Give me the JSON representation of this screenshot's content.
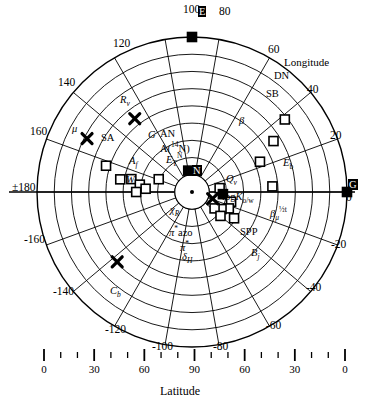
{
  "chart_data": {
    "type": "scatter",
    "plot_style": "polar",
    "title": "",
    "radial_axis": {
      "label": "Latitude",
      "ticks_major": [
        0,
        30,
        60,
        90,
        60,
        30,
        0
      ],
      "minor_ticks_per_interval": 2,
      "note": "radial distance axis drawn as a linear strip below the polar plot"
    },
    "angular_axis": {
      "label": "Longitude",
      "tick_labels": [
        "0",
        "20",
        "40",
        "60",
        "80",
        "100",
        "120",
        "140",
        "160",
        "±180",
        "-160",
        "-140",
        "-120",
        "-100",
        "-80",
        "-60",
        "-40",
        "-20"
      ],
      "tick_values": [
        0,
        20,
        40,
        60,
        80,
        100,
        120,
        140,
        160,
        180,
        -160,
        -140,
        -120,
        -100,
        -80,
        -60,
        -40,
        -20
      ],
      "direction": "counterclockwise",
      "zero_at": "east"
    },
    "grid": {
      "circles": 9,
      "radial_lines": 18,
      "grid_on": true
    },
    "markers": {
      "open_square": "open square marker",
      "filled_square": "filled square marker",
      "cross": "bold X cross marker",
      "dot": "small filled circle"
    },
    "points": [
      {
        "label": "E",
        "marker": "filled_square",
        "lon": 90,
        "r": 100,
        "label_pos": "left"
      },
      {
        "label": "G",
        "marker": "filled_square",
        "lon": 0,
        "r": 100,
        "label_pos": "left"
      },
      {
        "label": "N",
        "marker": "filled_square",
        "lon": 100,
        "r": 14,
        "label_pos": "left"
      },
      {
        "label": "DN",
        "marker": "open_square",
        "lon": 38,
        "r": 76,
        "label_pos": "left"
      },
      {
        "label": "SB",
        "marker": "open_square",
        "lon": 32,
        "r": 62,
        "label_pos": "left"
      },
      {
        "label": "β",
        "marker": "open_square",
        "lon": 24,
        "r": 48,
        "label_pos": "left"
      },
      {
        "label": "Eb",
        "marker": "open_square",
        "lon": 4,
        "r": 52,
        "label_pos": "left"
      },
      {
        "label": "SA",
        "marker": "open_square",
        "lon": 163,
        "r": 58,
        "label_pos": "left"
      },
      {
        "label": "G",
        "marker": "open_square",
        "lon": 170,
        "r": 47,
        "label_pos": "right"
      },
      {
        "label": "AN",
        "marker": "open_square",
        "lon": 168,
        "r": 40,
        "label_pos": "right"
      },
      {
        "label": "A(14N)",
        "marker": "open_square",
        "lon": 172,
        "r": 34,
        "label_pos": "right"
      },
      {
        "label": "Af",
        "marker": "open_square",
        "lon": 176,
        "r": 30,
        "label_pos": "left"
      },
      {
        "label": "ET N",
        "marker": "open_square",
        "lon": 159,
        "r": 23,
        "label_pos": "left"
      },
      {
        "label": "W",
        "marker": "open_square",
        "lon": 180,
        "r": 36,
        "label_pos": "left"
      },
      {
        "label": "Qv",
        "marker": "open_square",
        "lon": 8,
        "r": 18,
        "label_pos": "right"
      },
      {
        "label": "logKo/w",
        "marker": "filled_square",
        "lon": -4,
        "r": 20,
        "label_pos": "right"
      },
      {
        "label": "βμ",
        "marker": "open_square",
        "lon": -14,
        "r": 26,
        "label_pos": "right"
      },
      {
        "label": "SPP",
        "marker": "open_square",
        "lon": -24,
        "r": 26,
        "label_pos": "right"
      },
      {
        "label": "Bj",
        "marker": "open_square",
        "lon": -32,
        "r": 32,
        "label_pos": "right"
      },
      {
        "label": "π*azo",
        "marker": "open_square",
        "lon": -30,
        "r": 22,
        "label_pos": "left"
      },
      {
        "label": "π*",
        "marker": "open_square",
        "lon": -36,
        "r": 18,
        "label_pos": "left"
      },
      {
        "label": "δH",
        "marker": "open_square",
        "lon": -40,
        "r": 24,
        "label_pos": "left"
      },
      {
        "label": "Rv",
        "marker": "cross",
        "lon": 128,
        "r": 60,
        "label_pos": "left"
      },
      {
        "label": "μ",
        "marker": "cross",
        "lon": 153,
        "r": 76,
        "label_pos": "left"
      },
      {
        "label": "Cb",
        "marker": "cross",
        "lon": -137,
        "r": 66,
        "label_pos": "left"
      },
      {
        "label": "χR",
        "marker": "cross",
        "lon": -18,
        "r": 14,
        "label_pos": "left"
      }
    ]
  },
  "axes": {
    "angular_label": "Longitude",
    "radial_label": "Latitude",
    "angle_labels": {
      "a100": "100",
      "a80": "80",
      "a120": "120",
      "a60": "60",
      "a140": "140",
      "a40": "40",
      "a160": "160",
      "a20": "20",
      "a180": "±180",
      "a0": "0",
      "am160": "-160",
      "am20": "-20",
      "am140": "-140",
      "am40": "-40",
      "am120": "-120",
      "am60": "-60",
      "am100": "-100",
      "am80": "-80"
    },
    "bottom_ticks": [
      "0",
      "30",
      "60",
      "90",
      "60",
      "30",
      "0"
    ]
  },
  "point_labels": {
    "E": "E",
    "G_right": "G",
    "N": "N",
    "DN": "DN",
    "SB": "SB",
    "beta": "β",
    "Eb_main": "E",
    "Eb_sub": "b",
    "SA": "SA",
    "G_cluster": "G",
    "AN": "AN",
    "A14N_pre": "A(",
    "A14N_sup": "14",
    "A14N_post": "N)",
    "Af_main": "A",
    "Af_sub": "f",
    "ET_main": "E",
    "ET_sub": "T",
    "ET_sup": "N",
    "W_main": "W",
    "Qv_main": "Q",
    "Qv_sub": "v",
    "logK_pre": "log",
    "logK_K": "K",
    "logK_sub": "o/w",
    "beta_mu_main": "β",
    "beta_mu_sub": "μ",
    "beta_mu_sup": "½",
    "beta_mu_sup2": "t",
    "SPP": "SPP",
    "Bj_main": "B",
    "Bj_sub": "j",
    "pistar_azo_pi": "π",
    "pistar_azo_star": "*",
    "pistar_azo_rest": "azo",
    "pistar_pi": "π",
    "pistar_star": "*",
    "deltaH_main": "δ",
    "deltaH_sub": "H",
    "Rv_main": "R",
    "Rv_sub": "v",
    "mu": "μ",
    "Cb_main": "C",
    "Cb_sub": "b",
    "chiR_main": "χ",
    "chiR_sub": "R"
  },
  "colors": {
    "line": "#000000",
    "background": "#ffffff",
    "marker_fill": "#000000",
    "marker_open": "#ffffff"
  }
}
